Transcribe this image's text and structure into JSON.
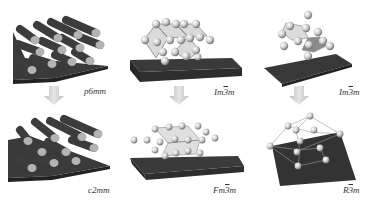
{
  "figure": {
    "columns": [
      {
        "id": "rods",
        "top": {
          "label_pre": "p6mm",
          "label_bar": "",
          "label_post": "",
          "structure": "hexagonal-rod-array"
        },
        "bottom": {
          "label_pre": "c2mm",
          "label_bar": "",
          "label_post": "",
          "structure": "centered-rectangular-rod-array"
        }
      },
      {
        "id": "bcc-fcc",
        "top": {
          "label_pre": "Im",
          "label_bar": "3",
          "label_post": "m",
          "structure": "bcc-sphere-lattice"
        },
        "bottom": {
          "label_pre": "Fm",
          "label_bar": "3",
          "label_post": "m",
          "structure": "fcc-sphere-lattice"
        }
      },
      {
        "id": "bcc-rhombo",
        "top": {
          "label_pre": "Im",
          "label_bar": "3",
          "label_post": "m",
          "structure": "bcc-unit-cell"
        },
        "bottom": {
          "label_pre": "R",
          "label_bar": "3",
          "label_post": "m",
          "structure": "rhombohedral-lattice"
        }
      }
    ],
    "arrow_icon": "down-arrow-icon",
    "colors": {
      "substrate": "#3a3a3a",
      "rod": "#4a4a4a",
      "rod_end": "#b8b8b8",
      "sphere": "#d8d8d8",
      "arrow": "#d0d0d0"
    }
  }
}
